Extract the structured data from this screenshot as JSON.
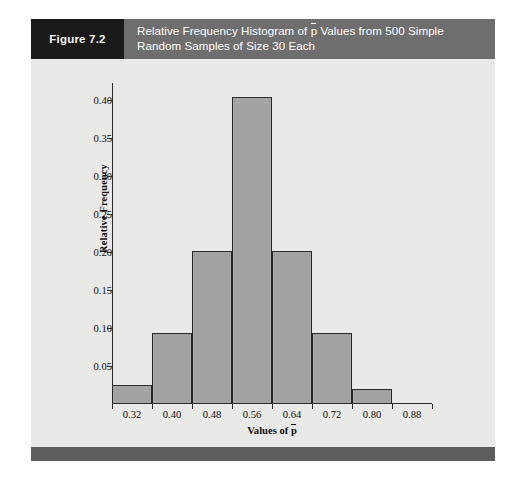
{
  "figure": {
    "number_label": "Figure 7.2",
    "title_line1_a": "Relative Frequency Histogram of ",
    "title_p": "p",
    "title_line1_b": " Values from 500 Simple",
    "title_line2": "Random Samples of Size 30 Each",
    "header_number_bg": "#1a1a1a",
    "header_title_bg": "#6e6e6e",
    "card_bg": "#e9e9e7",
    "footer_bg": "#5d5d5d"
  },
  "chart_data": {
    "type": "bar",
    "xlabel_prefix": "Values of ",
    "xlabel_symbol": "p",
    "ylabel": "Relative Frequency",
    "bin_edges": [
      0.28,
      0.36,
      0.44,
      0.52,
      0.6,
      0.68,
      0.76,
      0.84,
      0.92
    ],
    "categories": [
      "0.28-0.36",
      "0.36-0.44",
      "0.44-0.52",
      "0.52-0.60",
      "0.60-0.68",
      "0.68-0.76",
      "0.76-0.84",
      "0.84-0.92"
    ],
    "values": [
      0.025,
      0.093,
      0.202,
      0.404,
      0.202,
      0.093,
      0.02,
      0
    ],
    "xtick_labels": [
      "0.32",
      "0.40",
      "0.48",
      "0.56",
      "0.64",
      "0.72",
      "0.80",
      "0.88"
    ],
    "xtick_values": [
      0.32,
      0.4,
      0.48,
      0.56,
      0.64,
      0.72,
      0.8,
      0.88
    ],
    "ytick_labels": [
      "0.40",
      "0.35",
      "0.30",
      "0.25",
      "0.20",
      "0.15",
      "0.10",
      "0.05"
    ],
    "ytick_values": [
      0.4,
      0.35,
      0.3,
      0.25,
      0.2,
      0.15,
      0.1,
      0.05
    ],
    "xlim": [
      0.28,
      0.92
    ],
    "ylim": [
      0,
      0.4225
    ],
    "grid": false,
    "legend": false,
    "bar_fill": "#a3a3a1",
    "bar_edge": "#2b2b2b",
    "plot_bg": "#e9e9e7"
  }
}
